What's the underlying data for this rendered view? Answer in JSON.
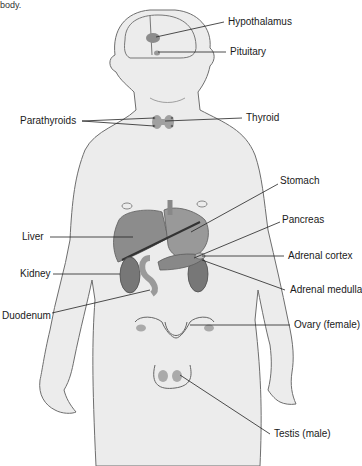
{
  "caption_fragment": "body.",
  "diagram": {
    "colors": {
      "skin": "#ececec",
      "outline": "#6e6e6e",
      "organ": "#8c8c8c",
      "organ_dark": "#707070",
      "gland": "#9a9a9a",
      "leader": "#222222"
    }
  },
  "labels": {
    "hypothalamus": "Hypothalamus",
    "pituitary": "Pituitary",
    "parathyroids": "Parathyroids",
    "thyroid": "Thyroid",
    "stomach": "Stomach",
    "liver": "Liver",
    "pancreas": "Pancreas",
    "kidney": "Kidney",
    "adrenal_cortex": "Adrenal cortex",
    "adrenal_medulla": "Adrenal medulla",
    "duodenum": "Duodenum",
    "ovary": "Ovary (female)",
    "testis": "Testis (male)"
  }
}
